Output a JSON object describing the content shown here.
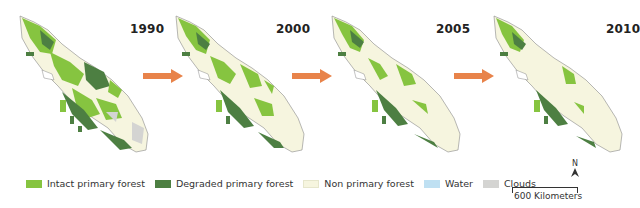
{
  "figure": {
    "panels": [
      {
        "year": "1990",
        "left": 0
      },
      {
        "year": "2000",
        "left": 160
      },
      {
        "year": "2005",
        "left": 318
      },
      {
        "year": "2010",
        "left": 478
      }
    ],
    "arrow_color": "#e8834a"
  },
  "legend": {
    "items": [
      {
        "label": "Intact primary forest",
        "color": "#86c440"
      },
      {
        "label": "Degraded primary forest",
        "color": "#4d7f42"
      },
      {
        "label": "Non primary forest",
        "color": "#f6f5df"
      },
      {
        "label": "Water",
        "color": "#bfe0f2"
      },
      {
        "label": "Clouds",
        "color": "#d4d4d2"
      }
    ]
  },
  "north_arrow": {
    "label": "N"
  },
  "scale_bar": {
    "label": "600 Kilometers"
  }
}
